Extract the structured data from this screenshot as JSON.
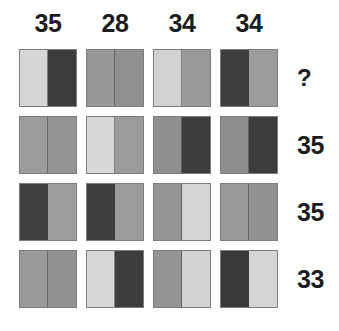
{
  "palette": {
    "light": "#d6d6d6",
    "mid": "#989898",
    "mid_dark": "#8e8e8e",
    "dark": "#3c3c3c",
    "background": "#ffffff",
    "text": "#1d1d1d",
    "border": "#7d7d7d"
  },
  "column_headers": [
    {
      "label": "35"
    },
    {
      "label": "28"
    },
    {
      "label": "34"
    },
    {
      "label": "34"
    }
  ],
  "row_labels": [
    {
      "label": "?"
    },
    {
      "label": "35"
    },
    {
      "label": "35"
    },
    {
      "label": "33"
    }
  ],
  "grid": {
    "rows": 4,
    "columns": 4,
    "cells": [
      [
        {
          "left": "#d6d6d6",
          "right": "#3c3c3c"
        },
        {
          "left": "#989898",
          "right": "#909090"
        },
        {
          "left": "#d2d2d2",
          "right": "#9a9a9a"
        },
        {
          "left": "#3f3f3f",
          "right": "#9c9c9c"
        }
      ],
      [
        {
          "left": "#9c9c9c",
          "right": "#949494"
        },
        {
          "left": "#d8d8d8",
          "right": "#9b9b9b"
        },
        {
          "left": "#8f8f8f",
          "right": "#3d3d3d"
        },
        {
          "left": "#8d8d8d",
          "right": "#3c3c3c"
        }
      ],
      [
        {
          "left": "#404040",
          "right": "#9d9d9d"
        },
        {
          "left": "#3e3e3e",
          "right": "#9b9b9b"
        },
        {
          "left": "#959595",
          "right": "#d4d4d4"
        },
        {
          "left": "#9a9a9a",
          "right": "#929292"
        }
      ],
      [
        {
          "left": "#9a9a9a",
          "right": "#929292"
        },
        {
          "left": "#d7d7d7",
          "right": "#3d3d3d"
        },
        {
          "left": "#949494",
          "right": "#d3d3d3"
        },
        {
          "left": "#3a3a3a",
          "right": "#d5d5d5"
        }
      ]
    ]
  }
}
